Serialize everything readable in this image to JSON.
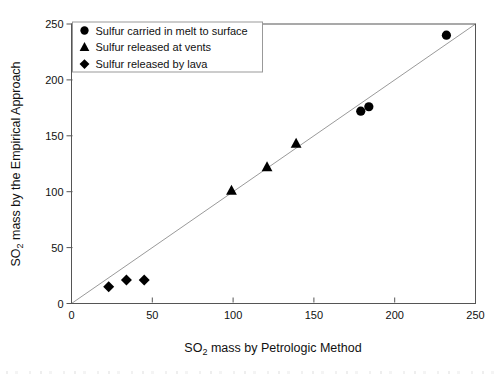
{
  "chart_data": {
    "type": "scatter",
    "title": "",
    "xlabel_parts": [
      "SO",
      "2",
      " mass by Petrologic Method"
    ],
    "ylabel_parts": [
      "SO",
      "2",
      " mass by the Empirical Approach"
    ],
    "xlim": [
      0,
      250
    ],
    "ylim": [
      0,
      250
    ],
    "xticks": [
      0,
      50,
      100,
      150,
      200,
      250
    ],
    "yticks": [
      0,
      50,
      100,
      150,
      200,
      250
    ],
    "grid": false,
    "legend_position": "upper-left",
    "reference_line": {
      "type": "identity",
      "from": [
        0,
        0
      ],
      "to": [
        250,
        250
      ],
      "color": "#9a9a9a"
    },
    "series": [
      {
        "name": "Sulfur carried in melt to surface",
        "marker": "circle",
        "color": "#000000",
        "points": [
          [
            179,
            172
          ],
          [
            184,
            176
          ],
          [
            232,
            240
          ]
        ]
      },
      {
        "name": "Sulfur released at vents",
        "marker": "triangle",
        "color": "#000000",
        "points": [
          [
            99,
            101
          ],
          [
            121,
            122
          ],
          [
            139,
            143
          ]
        ]
      },
      {
        "name": "Sulfur released by lava",
        "marker": "diamond",
        "color": "#000000",
        "points": [
          [
            23,
            15
          ],
          [
            34,
            21
          ],
          [
            45,
            21
          ]
        ]
      }
    ]
  },
  "colors": {
    "background": "#ffffff",
    "frame": "#555555",
    "legend_border": "#999999",
    "tick": "#555555",
    "text": "#111111",
    "marker": "#000000"
  }
}
